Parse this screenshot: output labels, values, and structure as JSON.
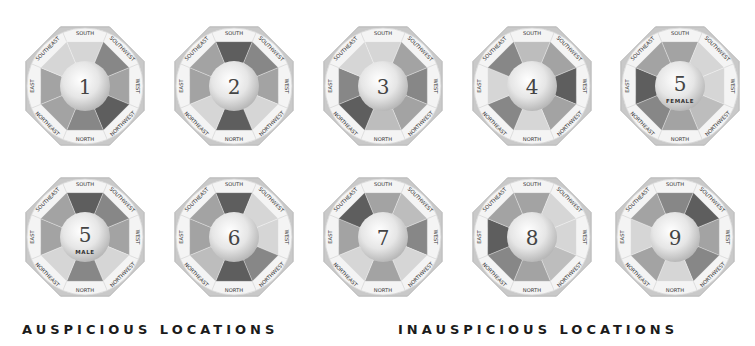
{
  "diagram": {
    "directions": [
      "SOUTH",
      "SOUTHWEST",
      "WEST",
      "NORTHWEST",
      "NORTH",
      "NORTHEAST",
      "EAST",
      "SOUTHEAST"
    ],
    "shade_palette": {
      "1": "#d6d6d6",
      "2": "#bdbdbd",
      "3": "#a3a3a3",
      "4": "#878787",
      "5": "#5e5e5e"
    },
    "frame_color": "#c9c9c9",
    "ring_color": "#f4f4f4",
    "charts": [
      {
        "number": "1",
        "sub": "",
        "cx": 85,
        "cy": 86,
        "shades": [
          1,
          4,
          3,
          5,
          4,
          3,
          3,
          1
        ]
      },
      {
        "number": "2",
        "sub": "",
        "cx": 234,
        "cy": 86,
        "shades": [
          5,
          4,
          3,
          1,
          5,
          1,
          3,
          3
        ]
      },
      {
        "number": "3",
        "sub": "",
        "cx": 383,
        "cy": 86,
        "shades": [
          1,
          3,
          4,
          3,
          2,
          5,
          4,
          1
        ]
      },
      {
        "number": "4",
        "sub": "",
        "cx": 532,
        "cy": 86,
        "shades": [
          2,
          3,
          5,
          3,
          1,
          4,
          1,
          4
        ]
      },
      {
        "number": "5",
        "sub": "FEMALE",
        "cx": 680,
        "cy": 86,
        "shades": [
          3,
          1,
          1,
          2,
          3,
          4,
          5,
          3
        ]
      },
      {
        "number": "5",
        "sub": "MALE",
        "cx": 85,
        "cy": 237,
        "shades": [
          5,
          4,
          3,
          1,
          4,
          1,
          3,
          3
        ]
      },
      {
        "number": "6",
        "sub": "",
        "cx": 234,
        "cy": 237,
        "shades": [
          5,
          1,
          1,
          4,
          5,
          2,
          3,
          3
        ]
      },
      {
        "number": "7",
        "sub": "",
        "cx": 383,
        "cy": 237,
        "shades": [
          3,
          2,
          4,
          1,
          3,
          1,
          3,
          5
        ]
      },
      {
        "number": "8",
        "sub": "",
        "cx": 532,
        "cy": 237,
        "shades": [
          3,
          1,
          1,
          2,
          3,
          4,
          5,
          3
        ]
      },
      {
        "number": "9",
        "sub": "",
        "cx": 675,
        "cy": 237,
        "shades": [
          4,
          5,
          3,
          4,
          1,
          3,
          1,
          3
        ]
      }
    ]
  },
  "captions": {
    "left": "AUSPICIOUS LOCATIONS",
    "right": "INAUSPICIOUS LOCATIONS"
  }
}
